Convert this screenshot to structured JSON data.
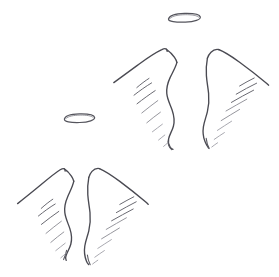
{
  "artwork": {
    "title": "Angel Wings Sketch",
    "medium": "pencil line drawing",
    "background_color": "#ffffff",
    "ink_color": "#4a4a52",
    "faint_ink_color": "#9a9aa2",
    "canvas": {
      "width": 279,
      "height": 277
    },
    "subjects": [
      {
        "name": "upper-wing-pair",
        "halo": {
          "name": "upper-halo",
          "center_x": 184,
          "center_y": 17.5,
          "radius_x": 16,
          "radius_y": 4.2,
          "tilt_deg": -2
        },
        "wings": [
          {
            "name": "upper-left-wing",
            "side": "left",
            "peak_x": 166,
            "peak_y": 50,
            "tip_x": 114,
            "tip_y": 82,
            "bottom_x": 173,
            "bottom_y": 148,
            "barb_count": 7
          },
          {
            "name": "upper-right-wing",
            "side": "right",
            "peak_x": 218,
            "peak_y": 50,
            "tip_x": 268,
            "tip_y": 88,
            "bottom_x": 212,
            "bottom_y": 148,
            "barb_count": 7
          }
        ]
      },
      {
        "name": "lower-wing-pair",
        "halo": {
          "name": "lower-halo",
          "center_x": 79,
          "center_y": 118,
          "radius_x": 15,
          "radius_y": 4.0,
          "tilt_deg": -2
        },
        "wings": [
          {
            "name": "lower-left-wing",
            "side": "left",
            "peak_x": 64,
            "peak_y": 168,
            "tip_x": 18,
            "tip_y": 203,
            "bottom_x": 63,
            "bottom_y": 258,
            "barb_count": 7
          },
          {
            "name": "lower-right-wing",
            "side": "right",
            "peak_x": 99,
            "peak_y": 168,
            "tip_x": 147,
            "tip_y": 203,
            "bottom_x": 96,
            "bottom_y": 262,
            "barb_count": 7
          }
        ]
      }
    ],
    "element_count": 6,
    "stroke_style": "hand-drawn freehand contour with hatched feather barbs"
  }
}
